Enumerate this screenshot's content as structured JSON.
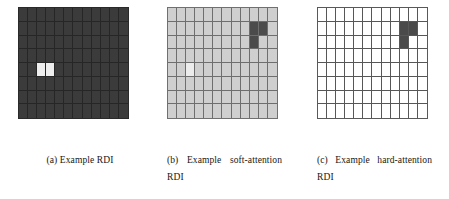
{
  "figure": {
    "background": "#ffffff",
    "panels": [
      {
        "id": "a",
        "caption": "(a) Example RDI",
        "grid": {
          "cols": 12,
          "rows": 8,
          "base_color": "#3b3b3b",
          "line_color": "#262626",
          "highlight_color": "#ededed",
          "dark_color": "#343434",
          "highlight_cells": [
            [
              4,
              2
            ],
            [
              4,
              3
            ]
          ],
          "dark_cells": []
        }
      },
      {
        "id": "b",
        "caption": "(b) Example soft-attention RDI",
        "grid": {
          "cols": 12,
          "rows": 8,
          "base_color": "#cfcfcf",
          "line_color": "#6e6e6e",
          "highlight_color": "#ececec",
          "dark_color": "#4b4b4b",
          "highlight_cells": [
            [
              4,
              2
            ]
          ],
          "dark_cells": [
            [
              1,
              9
            ],
            [
              1,
              10
            ],
            [
              2,
              9
            ]
          ]
        }
      },
      {
        "id": "c",
        "caption": "(c) Example hard-attention RDI",
        "grid": {
          "cols": 12,
          "rows": 8,
          "base_color": "#ffffff",
          "line_color": "#575757",
          "highlight_color": "#ffffff",
          "dark_color": "#4a4a4a",
          "highlight_cells": [],
          "dark_cells": [
            [
              1,
              9
            ],
            [
              1,
              10
            ],
            [
              2,
              9
            ]
          ]
        }
      }
    ]
  },
  "chart_data": {
    "type": "heatmap",
    "title": "",
    "xlabel": "",
    "ylabel": "",
    "grid": true,
    "legend_position": "none",
    "panels": [
      {
        "name": "(a) Example RDI",
        "rows": 8,
        "cols": 12,
        "values": [
          [
            0,
            0,
            0,
            0,
            0,
            0,
            0,
            0,
            0,
            0,
            0,
            0
          ],
          [
            0,
            0,
            0,
            0,
            0,
            0,
            0,
            0,
            0,
            0,
            0,
            0
          ],
          [
            0,
            0,
            0,
            0,
            0,
            0,
            0,
            0,
            0,
            0,
            0,
            0
          ],
          [
            0,
            0,
            0,
            0,
            0,
            0,
            0,
            0,
            0,
            0,
            0,
            0
          ],
          [
            0,
            0,
            1,
            1,
            0,
            0,
            0,
            0,
            0,
            0,
            0,
            0
          ],
          [
            0,
            0,
            0,
            0,
            0,
            0,
            0,
            0,
            0,
            0,
            0,
            0
          ],
          [
            0,
            0,
            0,
            0,
            0,
            0,
            0,
            0,
            0,
            0,
            0,
            0
          ],
          [
            0,
            0,
            0,
            0,
            0,
            0,
            0,
            0,
            0,
            0,
            0,
            0
          ]
        ]
      },
      {
        "name": "(b) Example soft-attention RDI",
        "rows": 8,
        "cols": 12,
        "values": [
          [
            0,
            0,
            0,
            0,
            0,
            0,
            0,
            0,
            0,
            0,
            0,
            0
          ],
          [
            0,
            0,
            0,
            0,
            0,
            0,
            0,
            0,
            0,
            2,
            2,
            0
          ],
          [
            0,
            0,
            0,
            0,
            0,
            0,
            0,
            0,
            0,
            2,
            0,
            0
          ],
          [
            0,
            0,
            0,
            0,
            0,
            0,
            0,
            0,
            0,
            0,
            0,
            0
          ],
          [
            0,
            0,
            1,
            0,
            0,
            0,
            0,
            0,
            0,
            0,
            0,
            0
          ],
          [
            0,
            0,
            0,
            0,
            0,
            0,
            0,
            0,
            0,
            0,
            0,
            0
          ],
          [
            0,
            0,
            0,
            0,
            0,
            0,
            0,
            0,
            0,
            0,
            0,
            0
          ],
          [
            0,
            0,
            0,
            0,
            0,
            0,
            0,
            0,
            0,
            0,
            0,
            0
          ]
        ]
      },
      {
        "name": "(c) Example hard-attention RDI",
        "rows": 8,
        "cols": 12,
        "values": [
          [
            0,
            0,
            0,
            0,
            0,
            0,
            0,
            0,
            0,
            0,
            0,
            0
          ],
          [
            0,
            0,
            0,
            0,
            0,
            0,
            0,
            0,
            0,
            2,
            2,
            0
          ],
          [
            0,
            0,
            0,
            0,
            0,
            0,
            0,
            0,
            0,
            2,
            0,
            0
          ],
          [
            0,
            0,
            0,
            0,
            0,
            0,
            0,
            0,
            0,
            0,
            0,
            0
          ],
          [
            0,
            0,
            0,
            0,
            0,
            0,
            0,
            0,
            0,
            0,
            0,
            0
          ],
          [
            0,
            0,
            0,
            0,
            0,
            0,
            0,
            0,
            0,
            0,
            0,
            0
          ],
          [
            0,
            0,
            0,
            0,
            0,
            0,
            0,
            0,
            0,
            0,
            0,
            0
          ],
          [
            0,
            0,
            0,
            0,
            0,
            0,
            0,
            0,
            0,
            0,
            0,
            0
          ]
        ]
      }
    ],
    "value_legend": {
      "0": "background cell",
      "1": "bright highlight cell",
      "2": "dark attention cell"
    }
  }
}
